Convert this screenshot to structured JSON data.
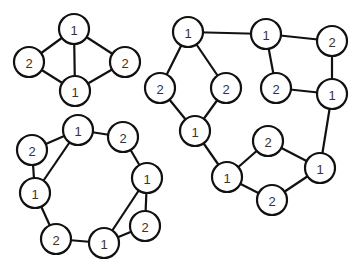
{
  "colors": {
    "stroke": "#111111",
    "fill": "#ffffff",
    "label": "#333333",
    "background": "#ffffff"
  },
  "graphs": [
    {
      "name": "graph-top-left",
      "nodes": [
        {
          "id": "a",
          "label": "1"
        },
        {
          "id": "b",
          "label": "2"
        },
        {
          "id": "c",
          "label": "2"
        },
        {
          "id": "d",
          "label": "1"
        }
      ],
      "edges": [
        [
          "a",
          "b"
        ],
        [
          "a",
          "c"
        ],
        [
          "a",
          "d"
        ],
        [
          "b",
          "d"
        ],
        [
          "c",
          "d"
        ]
      ]
    },
    {
      "name": "graph-bottom-left",
      "nodes": [
        {
          "id": "a",
          "label": "1"
        },
        {
          "id": "b",
          "label": "2"
        },
        {
          "id": "c",
          "label": "2"
        },
        {
          "id": "d",
          "label": "1"
        },
        {
          "id": "e",
          "label": "1"
        },
        {
          "id": "f",
          "label": "2"
        },
        {
          "id": "g",
          "label": "2"
        },
        {
          "id": "h",
          "label": "1"
        }
      ],
      "edges": [
        [
          "c",
          "a"
        ],
        [
          "a",
          "b"
        ],
        [
          "c",
          "e"
        ],
        [
          "a",
          "e"
        ],
        [
          "b",
          "d"
        ],
        [
          "d",
          "f"
        ],
        [
          "d",
          "h"
        ],
        [
          "e",
          "g"
        ],
        [
          "g",
          "h"
        ],
        [
          "h",
          "f"
        ]
      ]
    },
    {
      "name": "graph-right",
      "nodes": [
        {
          "id": "a",
          "label": "1"
        },
        {
          "id": "b",
          "label": "1"
        },
        {
          "id": "c",
          "label": "2"
        },
        {
          "id": "d",
          "label": "2"
        },
        {
          "id": "e",
          "label": "2"
        },
        {
          "id": "f",
          "label": "2"
        },
        {
          "id": "g",
          "label": "1"
        },
        {
          "id": "h",
          "label": "1"
        },
        {
          "id": "i",
          "label": "2"
        },
        {
          "id": "j",
          "label": "1"
        },
        {
          "id": "k",
          "label": "1"
        },
        {
          "id": "l",
          "label": "2"
        }
      ],
      "edges": [
        [
          "a",
          "b"
        ],
        [
          "a",
          "d"
        ],
        [
          "a",
          "e"
        ],
        [
          "d",
          "h"
        ],
        [
          "e",
          "h"
        ],
        [
          "b",
          "c"
        ],
        [
          "b",
          "f"
        ],
        [
          "f",
          "g"
        ],
        [
          "c",
          "g"
        ],
        [
          "g",
          "j"
        ],
        [
          "h",
          "k"
        ],
        [
          "k",
          "i"
        ],
        [
          "i",
          "j"
        ],
        [
          "k",
          "l"
        ],
        [
          "l",
          "j"
        ]
      ]
    }
  ]
}
